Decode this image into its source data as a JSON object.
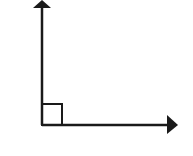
{
  "diagram": {
    "type": "right-angle-rays",
    "stroke_color": "#1a1a1a",
    "background_color": "#ffffff",
    "vertex": {
      "x": 42,
      "y": 125
    },
    "ray_up": {
      "end": {
        "x": 42,
        "y": 1
      },
      "arrowhead": true
    },
    "ray_right": {
      "end": {
        "x": 178,
        "y": 125
      },
      "arrowhead": true
    },
    "right_angle_marker": {
      "size": 20
    },
    "labels": []
  }
}
